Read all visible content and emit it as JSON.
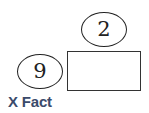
{
  "diagram": {
    "title": "X Fact",
    "top_oval": {
      "value": "2"
    },
    "left_oval": {
      "value": "9"
    },
    "answer_box": {
      "value": ""
    },
    "colors": {
      "title": "#3a4a6b",
      "stroke": "#222222",
      "background": "#ffffff"
    }
  }
}
